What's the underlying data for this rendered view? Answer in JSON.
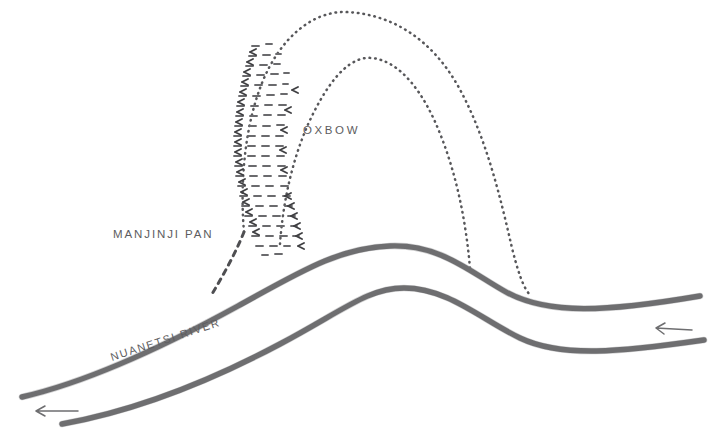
{
  "figure": {
    "background_color": "#ffffff",
    "ink_color": "#6e6e70",
    "width": 715,
    "height": 446
  },
  "labels": {
    "pan": "MANJINJI PAN",
    "oxbow": "OXBOW",
    "river": "NUANETSI RIVER"
  },
  "features": {
    "pan": {
      "name": "Manjinji Pan",
      "symbol": "marsh-stipple",
      "outline_style": "dashed"
    },
    "oxbow": {
      "name": "Oxbow",
      "symbol": "dotted-loop",
      "outline_style": "dotted"
    },
    "river": {
      "name": "Nuanetsi River",
      "symbol": "double-bank-line",
      "flow_direction": "right-to-left"
    }
  },
  "flow_arrows": [
    {
      "name": "flow-arrow-left",
      "direction": "left",
      "x": 55,
      "y": 411
    },
    {
      "name": "flow-arrow-right",
      "direction": "left",
      "x": 672,
      "y": 330
    }
  ]
}
